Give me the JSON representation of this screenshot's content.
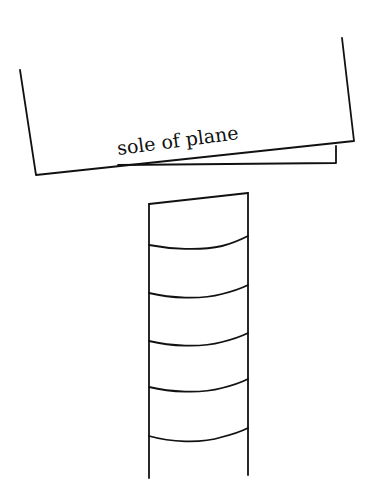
{
  "diagram": {
    "plane": {
      "label": "sole of plane"
    },
    "block": {
      "segment_count": 6
    },
    "colors": {
      "ink": "#111111",
      "background": "#ffffff"
    }
  }
}
